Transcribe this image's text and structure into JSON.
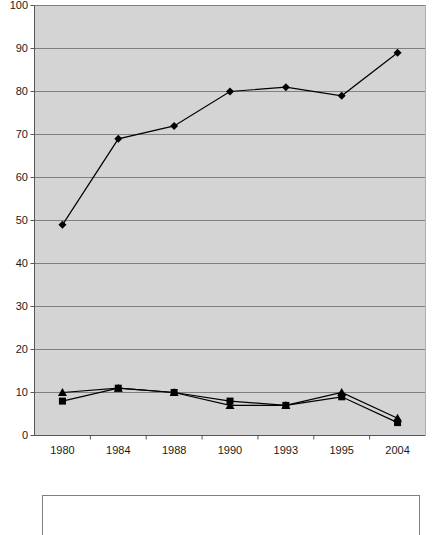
{
  "chart_data": {
    "type": "line",
    "title": "",
    "xlabel": "",
    "ylabel": "",
    "categories": [
      "1980",
      "1984",
      "1988",
      "1990",
      "1993",
      "1995",
      "2004"
    ],
    "ylim": [
      0,
      100
    ],
    "ytick_step": 10,
    "yticks": [
      "0",
      "10",
      "20",
      "30",
      "40",
      "50",
      "60",
      "70",
      "80",
      "90",
      "100"
    ],
    "grid": "horizontal",
    "legend_position": "bottom",
    "series": [
      {
        "name": "series-1",
        "marker": "diamond",
        "color": "#000000",
        "values": [
          49,
          69,
          72,
          80,
          81,
          79,
          89
        ]
      },
      {
        "name": "series-2",
        "marker": "square",
        "color": "#000000",
        "values": [
          8,
          11,
          10,
          8,
          7,
          9,
          3
        ]
      },
      {
        "name": "series-3",
        "marker": "triangle",
        "color": "#000000",
        "values": [
          10,
          11,
          10,
          7,
          7,
          10,
          4
        ]
      }
    ],
    "plot_background": "#d4d4d4",
    "gridline_color": "#808080",
    "axis_color": "#555555"
  },
  "legend": {
    "label": ""
  }
}
